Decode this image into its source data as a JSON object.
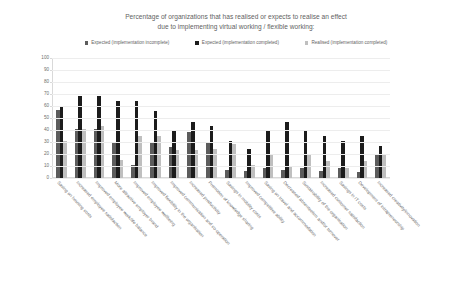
{
  "title": {
    "line1": "Percentage of organizations that has realised or expects to realise an effect",
    "line2": "due to implementing virtual working / flexible working:"
  },
  "legend": {
    "position": "top",
    "items": [
      {
        "label": "Expected (implementation incomplete)",
        "color": "#5c5c5c"
      },
      {
        "label": "Expected (implementation completed)",
        "color": "#1c1c1c"
      },
      {
        "label": "Realised (implementation completed)",
        "color": "#bfbfbf"
      }
    ]
  },
  "chart_data": {
    "type": "bar",
    "title": "Percentage of organizations that has realised or expects to realise an effect due to implementing virtual working / flexible working:",
    "xlabel": "",
    "ylabel": "",
    "ylim": [
      0,
      100
    ],
    "yticks": [
      0,
      10,
      20,
      30,
      40,
      50,
      60,
      70,
      80,
      90,
      100
    ],
    "grid": true,
    "legend_position": "top",
    "categories": [
      "Saving on housing costs",
      "Increased employee satisfaction",
      "Improved employee work/life balance",
      "More attractive employer brand",
      "Improved employee wellbeing",
      "Improved flexibility in the organisation",
      "Improved communication and co-operation",
      "Increased productivity",
      "Promotion of knowledge sharing",
      "Savings in mobility costs",
      "Improved competitive ability",
      "Saving on travel and accommodation",
      "Decreased absenteeism and/or turnover",
      "Sustainability of the organisation",
      "Increased customer satisfaction",
      "Savings in IT costs",
      "Development of intrapreneurship",
      "Increased creativity/innovation"
    ],
    "series": [
      {
        "name": "Expected (implementation incomplete)",
        "color": "#5c5c5c",
        "values": [
          57,
          41,
          41,
          30,
          11,
          30,
          26,
          38,
          30,
          7,
          6,
          8,
          7,
          8,
          6,
          8,
          5,
          19
        ]
      },
      {
        "name": "Expected (implementation completed)",
        "color": "#1c1c1c",
        "values": [
          59,
          68,
          68,
          64,
          64,
          56,
          40,
          47,
          43,
          31,
          24,
          40,
          47,
          40,
          35,
          31,
          35,
          27
        ]
      },
      {
        "name": "Realised (implementation completed)",
        "color": "#bfbfbf",
        "values": [
          31,
          41,
          43,
          15,
          35,
          35,
          23,
          23,
          24,
          28,
          11,
          19,
          9,
          20,
          14,
          8,
          14,
          19
        ]
      }
    ]
  }
}
